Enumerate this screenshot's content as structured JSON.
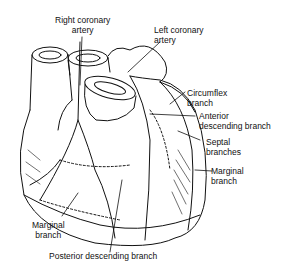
{
  "diagram": {
    "labels": [
      {
        "id": "right-coronary-artery",
        "text": "Right coronary\nartery"
      },
      {
        "id": "left-coronary-artery",
        "text": "Left coronary\nartery"
      },
      {
        "id": "circumflex-branch",
        "text": "Circumflex\nbranch"
      },
      {
        "id": "anterior-descending-branch",
        "text": "Anterior\ndescending branch"
      },
      {
        "id": "septal-branches",
        "text": "Septal\nbranches"
      },
      {
        "id": "marginal-branch-right",
        "text": "Marginal\nbranch"
      },
      {
        "id": "marginal-branch-left",
        "text": "Marginal\nbranch"
      },
      {
        "id": "posterior-descending-branch",
        "text": "Posterior descending branch"
      }
    ],
    "colors": {
      "line": "#111111",
      "background": "#ffffff"
    }
  }
}
